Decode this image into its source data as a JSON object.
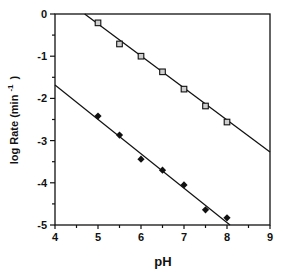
{
  "chart_data": {
    "type": "scatter",
    "title": "",
    "xlabel": "pH",
    "ylabel": "log Rate (min -1 )",
    "ylabel_main": "log Rate (min",
    "ylabel_sup": "-1",
    "ylabel_close": ")",
    "xlim": [
      4,
      9
    ],
    "ylim": [
      -5,
      0
    ],
    "x_ticks": [
      4,
      5,
      6,
      7,
      8,
      9
    ],
    "y_ticks": [
      0,
      -1,
      -2,
      -3,
      -4,
      -5
    ],
    "x_tick_labels": [
      "4",
      "5",
      "6",
      "7",
      "8",
      "9"
    ],
    "y_tick_labels": [
      "0",
      "-1",
      "-2",
      "-3",
      "-4",
      "-5"
    ],
    "grid": false,
    "legend": null,
    "series": [
      {
        "name": "open squares",
        "marker": "square-open",
        "x": [
          5.0,
          5.5,
          6.0,
          6.5,
          7.0,
          7.5,
          8.0
        ],
        "y": [
          -0.21,
          -0.71,
          -1.0,
          -1.37,
          -1.78,
          -2.18,
          -2.56
        ],
        "fit_line": {
          "x": [
            4.69,
            9.0
          ],
          "y": [
            0.0,
            -3.27
          ]
        }
      },
      {
        "name": "filled diamonds",
        "marker": "diamond-filled",
        "x": [
          5.0,
          5.5,
          6.0,
          6.5,
          7.0,
          7.5,
          8.0
        ],
        "y": [
          -2.42,
          -2.87,
          -3.44,
          -3.7,
          -4.05,
          -4.64,
          -4.83
        ],
        "fit_line": {
          "x": [
            4.0,
            8.07
          ],
          "y": [
            -1.68,
            -5.0
          ]
        }
      }
    ]
  },
  "colors": {
    "ink": "#111111",
    "marker_fill_open": "#cfcfcf",
    "background": "#ffffff"
  }
}
